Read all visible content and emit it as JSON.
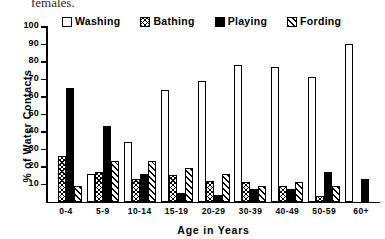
{
  "caption_fragment": "females.",
  "legend": {
    "position": "top",
    "items": [
      {
        "label": "Washing",
        "pattern": "empty",
        "color": "#ffffff"
      },
      {
        "label": "Bathing",
        "pattern": "cross-hatch",
        "color": "#000000"
      },
      {
        "label": "Playing",
        "pattern": "solid",
        "color": "#000000"
      },
      {
        "label": "Fording",
        "pattern": "diagonal",
        "color": "#000000"
      }
    ]
  },
  "chart_data": {
    "type": "bar",
    "title": "",
    "xlabel": "Age in Years",
    "ylabel": "% of Water Contacts",
    "categories": [
      "0-4",
      "5-9",
      "10-14",
      "15-19",
      "20-29",
      "30-39",
      "40-49",
      "50-59",
      "60+"
    ],
    "yticks": [
      10,
      20,
      30,
      40,
      50,
      60,
      70,
      80,
      90,
      100
    ],
    "ylim": [
      0,
      100
    ],
    "grid": false,
    "series": [
      {
        "name": "Washing",
        "pattern": "empty",
        "values": [
          0,
          16,
          34,
          64,
          69,
          78,
          77,
          71,
          90
        ]
      },
      {
        "name": "Bathing",
        "pattern": "cross-hatch",
        "values": [
          26,
          17,
          13,
          15,
          12,
          11,
          9,
          3,
          0
        ]
      },
      {
        "name": "Playing",
        "pattern": "solid",
        "values": [
          65,
          43,
          16,
          5,
          4,
          7,
          7,
          17,
          13
        ]
      },
      {
        "name": "Fording",
        "pattern": "diagonal",
        "values": [
          9,
          23,
          23,
          19,
          16,
          9,
          11,
          9,
          0
        ]
      }
    ]
  }
}
